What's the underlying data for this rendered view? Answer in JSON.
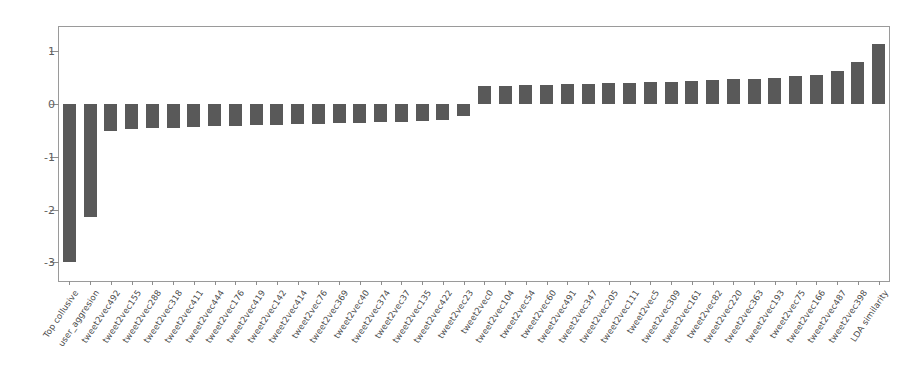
{
  "chart_data": {
    "type": "bar",
    "title": "",
    "xlabel": "",
    "ylabel": "",
    "ylim": [
      -3.35,
      1.45
    ],
    "yticks": [
      1,
      0,
      -1,
      -2,
      -3
    ],
    "ytick_labels": [
      "1",
      "0",
      "-1",
      "-2",
      "-3"
    ],
    "grid": false,
    "legend": null,
    "bar_color": "#595959",
    "axis_color": "#9a9a9a",
    "categories": [
      "Top collusive",
      "user_aggresion",
      "tweet2vec492",
      "tweet2vec155",
      "tweet2vec288",
      "tweet2vec318",
      "tweet2vec411",
      "tweet2vec444",
      "tweet2vec176",
      "tweet2vec419",
      "tweet2vec142",
      "tweet2vec414",
      "tweet2vec76",
      "tweet2vec369",
      "tweet2vec40",
      "tweet2vec374",
      "tweet2vec37",
      "tweet2vec135",
      "tweet2vec422",
      "tweet2vec23",
      "tweet2vec0",
      "tweet2vec104",
      "tweet2vec54",
      "tweet2vec60",
      "tweet2vec491",
      "tweet2vec347",
      "tweet2vec205",
      "tweet2vec111",
      "tweet2vec5",
      "tweet2vec309",
      "tweet2vec161",
      "tweet2vec82",
      "tweet2vec220",
      "tweet2vec363",
      "tweet2vec193",
      "tweet2vec75",
      "tweet2vec166",
      "tweet2vec487",
      "tweet2vec398",
      "LDA similarity"
    ],
    "values": [
      -3.0,
      -2.15,
      -0.51,
      -0.47,
      -0.46,
      -0.45,
      -0.44,
      -0.43,
      -0.42,
      -0.41,
      -0.4,
      -0.39,
      -0.38,
      -0.37,
      -0.36,
      -0.35,
      -0.34,
      -0.33,
      -0.31,
      -0.24,
      0.33,
      0.34,
      0.35,
      0.36,
      0.37,
      0.38,
      0.39,
      0.4,
      0.41,
      0.42,
      0.43,
      0.44,
      0.46,
      0.47,
      0.49,
      0.52,
      0.55,
      0.62,
      0.78,
      1.13
    ]
  }
}
